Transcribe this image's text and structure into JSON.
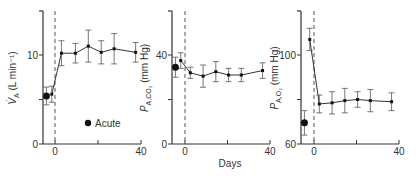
{
  "chart_data": [
    {
      "type": "line",
      "panel": "A",
      "ylabel": "V̇A (L min⁻¹)",
      "xlabel": "",
      "ylim": [
        0,
        13
      ],
      "yticks": [
        0,
        5,
        10
      ],
      "ytick_labels": [
        "0",
        "",
        "10"
      ],
      "xlim": [
        -6,
        40
      ],
      "xticks": [
        0,
        20,
        40
      ],
      "xtick_labels": [
        "0",
        "",
        "40"
      ],
      "vline_x": 0,
      "acute": {
        "x": -4,
        "y": 5.4,
        "err": 1.0
      },
      "series": [
        {
          "name": "Chronic",
          "x": [
            -1.5,
            3,
            9.5,
            15.5,
            21.5,
            27.5,
            37.5
          ],
          "y": [
            5.6,
            10.2,
            10.2,
            11.0,
            10.3,
            10.7,
            10.3
          ],
          "err": [
            0.9,
            1.4,
            1.1,
            1.8,
            1.3,
            1.7,
            1.1
          ]
        }
      ],
      "legend": {
        "marker": "filled-circle",
        "label": "Acute"
      }
    },
    {
      "type": "line",
      "panel": "B",
      "ylabel": "PA,CO2 (mm Hg)",
      "xlabel": "Days",
      "ylim": [
        0,
        52
      ],
      "yticks": [
        0,
        20,
        40
      ],
      "ytick_labels": [
        "0",
        "",
        "40"
      ],
      "xlim": [
        -6,
        40
      ],
      "xticks": [
        0,
        20,
        40
      ],
      "xtick_labels": [
        "0",
        "",
        "40"
      ],
      "vline_x": 0,
      "acute": {
        "x": -4.5,
        "y": 34.5,
        "err": 4.5
      },
      "series": [
        {
          "name": "Chronic",
          "x": [
            -2,
            2.5,
            8.5,
            14.5,
            20.5,
            26.5,
            36.5
          ],
          "y": [
            37.5,
            32,
            30.5,
            32.5,
            31,
            31,
            33
          ],
          "err": [
            3.5,
            2.5,
            5,
            4.5,
            3,
            3,
            3.5
          ]
        }
      ]
    },
    {
      "type": "line",
      "panel": "C",
      "ylabel": "PA,O2 (mm Hg)",
      "xlabel": "",
      "ylim": [
        60,
        120
      ],
      "yticks": [
        60,
        80,
        100
      ],
      "ytick_labels": [
        "60",
        "",
        "100"
      ],
      "xlim": [
        -6,
        40
      ],
      "xticks": [
        0,
        20,
        40
      ],
      "xtick_labels": [
        "0",
        "",
        "40"
      ],
      "vline_x": 0,
      "acute": {
        "x": -4.5,
        "y": 69.5,
        "err": 5.5
      },
      "series": [
        {
          "name": "Chronic",
          "x": [
            -2,
            2.5,
            8.5,
            14.5,
            20.5,
            26.5,
            36.5
          ],
          "y": [
            107,
            78,
            78.5,
            79.5,
            80,
            79.5,
            79
          ],
          "err": [
            5,
            4,
            5,
            5.5,
            3.5,
            5,
            4
          ]
        }
      ]
    }
  ],
  "labels": {
    "panel1_y": "V̇A (L min⁻¹)",
    "panel2_y": "PA,CO2 (mm Hg)",
    "panel3_y": "PA,O2 (mm Hg)",
    "days": "Days",
    "legend": "Acute"
  }
}
